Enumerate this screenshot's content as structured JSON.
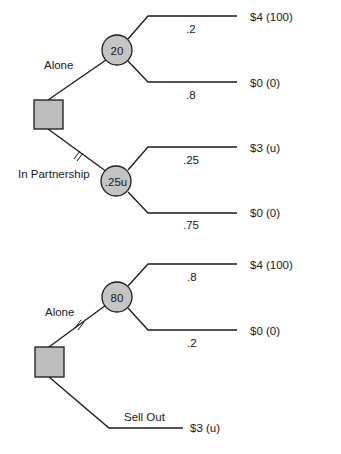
{
  "trees": [
    {
      "id": "tree-1",
      "decision_node": {
        "shape": "square"
      },
      "branches": [
        {
          "label": "Alone",
          "blocked": false,
          "chance_node": {
            "value": "20"
          },
          "outcomes": [
            {
              "probability": ".2",
              "payoff": "$4 (100)"
            },
            {
              "probability": ".8",
              "payoff": "$0 (0)"
            }
          ]
        },
        {
          "label": "In Partnership",
          "blocked": true,
          "chance_node": {
            "value": ".25u"
          },
          "outcomes": [
            {
              "probability": ".25",
              "payoff": "$3 (u)"
            },
            {
              "probability": ".75",
              "payoff": "$0 (0)"
            }
          ]
        }
      ]
    },
    {
      "id": "tree-2",
      "decision_node": {
        "shape": "square"
      },
      "branches": [
        {
          "label": "Alone",
          "blocked": true,
          "chance_node": {
            "value": "80"
          },
          "outcomes": [
            {
              "probability": ".8",
              "payoff": "$4 (100)"
            },
            {
              "probability": ".2",
              "payoff": "$0 (0)"
            }
          ]
        },
        {
          "label": "Sell Out",
          "blocked": false,
          "terminal_payoff": "$3 (u)"
        }
      ]
    }
  ],
  "colors": {
    "node_fill": "#c4c4c4",
    "line": "#1a1a1a",
    "background": "#ffffff"
  }
}
